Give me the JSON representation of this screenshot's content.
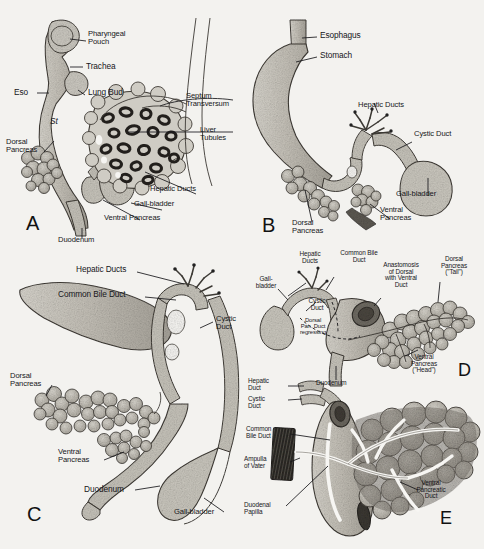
{
  "figure": {
    "background_color": "#f3f2ef",
    "ink_color": "#16161a",
    "tissue_fill": "#c9c6bf",
    "tissue_stroke": "#4a4640",
    "panel_count": 5
  },
  "panels": [
    {
      "id": "A",
      "letter": "A",
      "labels": [
        {
          "key": "pharyngeal_pouch",
          "text": "Pharyngeal\nPouch"
        },
        {
          "key": "trachea",
          "text": "Trachea"
        },
        {
          "key": "eso",
          "text": "Eso"
        },
        {
          "key": "lung_bud",
          "text": "Lung Bud"
        },
        {
          "key": "septum_transversum",
          "text": "Septum\nTransversum"
        },
        {
          "key": "liver_tubules",
          "text": "Liver\nTubules"
        },
        {
          "key": "st",
          "text": "St"
        },
        {
          "key": "dorsal_pancreas",
          "text": "Dorsal\nPancreas"
        },
        {
          "key": "hepatic_ducts",
          "text": "Hepatic Ducts"
        },
        {
          "key": "gall_bladder",
          "text": "Gall-bladder"
        },
        {
          "key": "ventral_pancreas",
          "text": "Ventral Pancreas"
        },
        {
          "key": "duodenum",
          "text": "Duodenum"
        }
      ]
    },
    {
      "id": "B",
      "letter": "B",
      "labels": [
        {
          "key": "esophagus",
          "text": "Esophagus"
        },
        {
          "key": "stomach",
          "text": "Stomach"
        },
        {
          "key": "hepatic_ducts",
          "text": "Hepatic Ducts"
        },
        {
          "key": "cystic_duct",
          "text": "Cystic Duct"
        },
        {
          "key": "gall_bladder",
          "text": "Gall-bladder"
        },
        {
          "key": "dorsal_pancreas",
          "text": "Dorsal\nPancreas"
        },
        {
          "key": "ventral_pancreas",
          "text": "Ventral\nPancreas"
        }
      ]
    },
    {
      "id": "C",
      "letter": "C",
      "labels": [
        {
          "key": "hepatic_ducts",
          "text": "Hepatic Ducts"
        },
        {
          "key": "common_bile_duct",
          "text": "Common Bile Duct"
        },
        {
          "key": "cystic_duct",
          "text": "Cystic\nDuct"
        },
        {
          "key": "dorsal_pancreas",
          "text": "Dorsal\nPancreas"
        },
        {
          "key": "ventral_pancreas",
          "text": "Ventral\nPancreas"
        },
        {
          "key": "duodenum",
          "text": "Duodenum"
        },
        {
          "key": "gall_bladder",
          "text": "Gall-bladder"
        }
      ]
    },
    {
      "id": "D",
      "letter": "D",
      "labels": [
        {
          "key": "hepatic_ducts",
          "text": "Hepatic\nDucts"
        },
        {
          "key": "common_bile_duct",
          "text": "Common Bile\nDuct"
        },
        {
          "key": "anastomosis",
          "text": "Anastomosis\nof Dorsal\nwith Ventral\nDuct"
        },
        {
          "key": "dorsal_pancreas_tail",
          "text": "Dorsal\nPancreas\n(\"Tail\")"
        },
        {
          "key": "gall_bladder",
          "text": "Gall-\nbladder"
        },
        {
          "key": "cystic_duct",
          "text": "Cystic\nDuct"
        },
        {
          "key": "dorsal_pan_duct_regressing",
          "text": "Dorsal\nPan. Duct\nregressing"
        },
        {
          "key": "ventral_pancreas_head",
          "text": "Ventral\nPancreas\n(\"Head\")"
        },
        {
          "key": "duodenum",
          "text": "Duodenum"
        }
      ]
    },
    {
      "id": "E",
      "letter": "E",
      "labels": [
        {
          "key": "hepatic_duct",
          "text": "Hepatic\nDuct"
        },
        {
          "key": "cystic_duct",
          "text": "Cystic\nDuct"
        },
        {
          "key": "common_bile_duct",
          "text": "Common\nBile Duct"
        },
        {
          "key": "ampulla_of_vater",
          "text": "Ampulla\nof Vater"
        },
        {
          "key": "duodenal_papilla",
          "text": "Duodenal\nPapilla"
        },
        {
          "key": "ventral_pancreatic_duct",
          "text": "Ventral\nPancreatic\nDuct"
        }
      ]
    }
  ]
}
